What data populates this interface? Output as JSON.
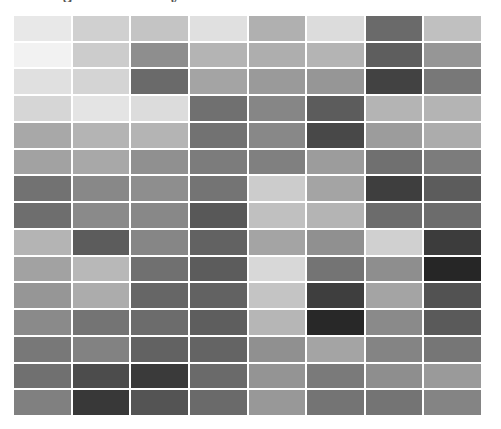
{
  "chart_data": {
    "type": "heatmap",
    "title": "",
    "title_fragments_visible": [
      "g",
      "y"
    ],
    "rows": 15,
    "columns": 8,
    "colormap": "grayscale (darker = higher intensity)",
    "xlabel": "",
    "ylabel": "",
    "grid_lines": "white separators",
    "legend": "none",
    "gray_levels": [
      [
        232,
        208,
        196,
        224,
        176,
        220,
        106,
        192
      ],
      [
        242,
        204,
        142,
        180,
        174,
        180,
        94,
        150
      ],
      [
        224,
        212,
        106,
        164,
        154,
        150,
        66,
        120
      ],
      [
        214,
        228,
        220,
        112,
        134,
        92,
        180,
        180
      ],
      [
        168,
        180,
        180,
        114,
        136,
        72,
        156,
        172
      ],
      [
        162,
        168,
        144,
        124,
        128,
        156,
        112,
        124
      ],
      [
        114,
        136,
        142,
        116,
        204,
        164,
        62,
        92
      ],
      [
        110,
        138,
        136,
        88,
        192,
        180,
        108,
        108
      ],
      [
        180,
        92,
        134,
        98,
        164,
        144,
        208,
        60
      ],
      [
        162,
        184,
        112,
        92,
        216,
        116,
        142,
        38
      ],
      [
        150,
        172,
        102,
        98,
        196,
        62,
        164,
        82
      ],
      [
        138,
        116,
        108,
        94,
        182,
        40,
        138,
        90
      ],
      [
        120,
        130,
        98,
        100,
        144,
        164,
        132,
        118
      ],
      [
        112,
        76,
        58,
        106,
        148,
        122,
        142,
        154
      ],
      [
        128,
        56,
        84,
        106,
        152,
        116,
        116,
        132
      ]
    ]
  }
}
